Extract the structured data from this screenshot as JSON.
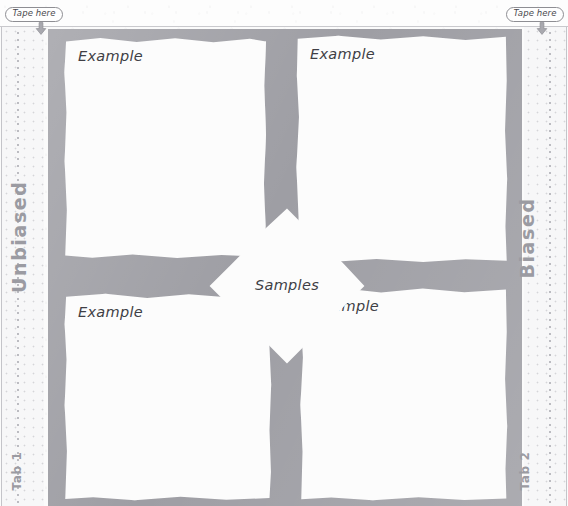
{
  "markers": {
    "left": {
      "label": "Tape here",
      "icon": "down-arrow-icon"
    },
    "right": {
      "label": "Tape here",
      "icon": "down-arrow-icon"
    }
  },
  "side_labels": {
    "left_axis": "Unbiased",
    "right_axis": "Biased",
    "left_tab": "Tab 1",
    "right_tab": "Tab 2"
  },
  "center": {
    "label": "Samples"
  },
  "quadrants": [
    {
      "id": "top-left",
      "label": "Example"
    },
    {
      "id": "top-right",
      "label": "Example"
    },
    {
      "id": "bottom-left",
      "label": "Example"
    },
    {
      "id": "bottom-right",
      "label": "Example"
    }
  ],
  "colors": {
    "paper": "#fbfbfb",
    "card": "#fcfcfc",
    "mortar": "#9e9ea4",
    "label": "#9b9ba2",
    "ink": "#3f3f45",
    "rule": "#c4c4c9"
  }
}
